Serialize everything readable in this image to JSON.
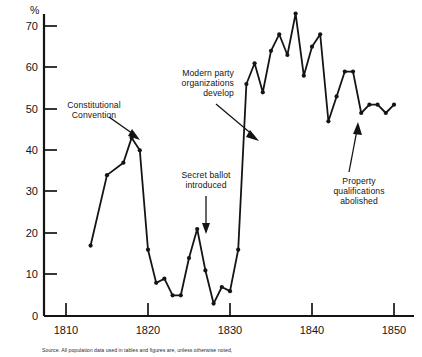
{
  "chart_data": {
    "type": "line",
    "title": "",
    "subtitle": "",
    "xlabel": "",
    "ylabel": "",
    "yunit": "%",
    "xlim": [
      1805,
      1851.5
    ],
    "ylim": [
      0,
      74
    ],
    "xticks": [
      1810,
      1820,
      1830,
      1840,
      1850
    ],
    "yticks": [
      0,
      10,
      20,
      30,
      40,
      50,
      60,
      70
    ],
    "grid": false,
    "legend": false,
    "markers": true,
    "series": [
      {
        "name": "Voter turnout",
        "x": [
          1813,
          1815,
          1817,
          1818,
          1819,
          1820,
          1821,
          1822,
          1823,
          1824,
          1825,
          1826,
          1827,
          1828,
          1829,
          1830,
          1831,
          1832,
          1833,
          1834,
          1835,
          1836,
          1837,
          1838,
          1839,
          1840,
          1841,
          1842,
          1843,
          1844,
          1845,
          1846,
          1847,
          1848,
          1849,
          1850
        ],
        "y": [
          17,
          34,
          37,
          43,
          40,
          16,
          8,
          9,
          5,
          5,
          14,
          21,
          11,
          3,
          7,
          6,
          16,
          56,
          61,
          54,
          64,
          68,
          63,
          73,
          58,
          65,
          68,
          47,
          53,
          59,
          59,
          49,
          51,
          51,
          49,
          51
        ]
      }
    ],
    "annotations": [
      {
        "name": "constitutional-convention",
        "text": "Constitutional\nConvention",
        "target_x": 1818,
        "target_y": 43,
        "arrow": "down-right"
      },
      {
        "name": "modern-party-organizations-develop",
        "text": "Modern party\norganizations\ndevelop",
        "target_x": 1833,
        "target_y": 50,
        "arrow": "down-right"
      },
      {
        "name": "secret-ballot-introduced",
        "text": "Secret ballot\nintroduced",
        "target_x": 1826,
        "target_y": 21,
        "arrow": "down"
      },
      {
        "name": "property-qualifications-abolished",
        "text": "Property\nqualifications\nabolished",
        "target_x": 1842,
        "target_y": 47,
        "arrow": "up"
      }
    ]
  },
  "axes": {
    "y_unit_label": "%",
    "y_tick_labels": [
      "0",
      "10",
      "20",
      "30",
      "40",
      "50",
      "60",
      "70"
    ],
    "x_tick_labels": [
      "1810",
      "1820",
      "1830",
      "1840",
      "1850"
    ]
  },
  "annotations": {
    "constitutional_convention": "Constitutional\nConvention",
    "modern_party": "Modern party\norganizations\ndevelop",
    "secret_ballot": "Secret ballot\nintroduced",
    "property_qualifications": "Property\nqualifications\nabolished"
  },
  "source_note": "Source. All population data used in tables and figures are, unless otherwise noted,"
}
